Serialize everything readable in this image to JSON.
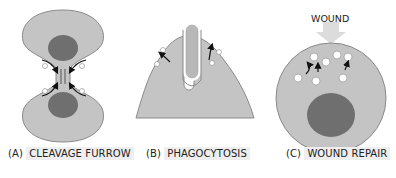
{
  "panels": [
    {
      "id": "A",
      "prefix": "(A)",
      "title": "CLEAVAGE FURROW"
    },
    {
      "id": "B",
      "prefix": "(B)",
      "title": "PHAGOCYTOSIS"
    },
    {
      "id": "C",
      "prefix": "(C)",
      "title": "WOUND REPAIR"
    }
  ],
  "annotations": {
    "wound": "WOUND"
  },
  "colors": {
    "cytoplasm": "#c4c4c4",
    "outline": "#8a8a8a",
    "nucleus": "#6f6f6f",
    "vesicle": "#ffffff",
    "arrow": "#111111",
    "wound_arrow": "#dcdcdc",
    "label_bg": "#eeeeee"
  }
}
